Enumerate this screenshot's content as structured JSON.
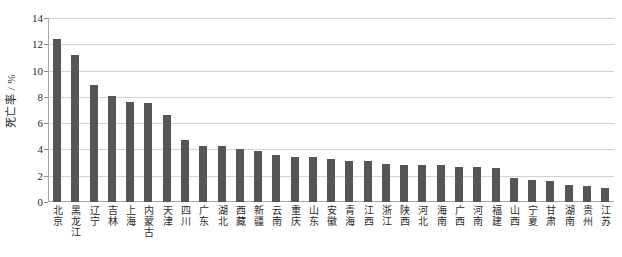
{
  "chart_data": {
    "type": "bar",
    "title": "",
    "xlabel": "",
    "ylabel": "死亡率 / %",
    "ylim": [
      0,
      14
    ],
    "yticks": [
      0,
      2,
      4,
      6,
      8,
      10,
      12,
      14
    ],
    "grid": true,
    "legend": "none",
    "bar_color": "#565656",
    "categories": [
      "北京",
      "黑龙江",
      "辽宁",
      "吉林",
      "上海",
      "内蒙古",
      "天津",
      "四川",
      "广东",
      "湖北",
      "西藏",
      "新疆",
      "云南",
      "重庆",
      "山东",
      "安徽",
      "青海",
      "江西",
      "浙江",
      "陕西",
      "河北",
      "海南",
      "广西",
      "河南",
      "福建",
      "山西",
      "宁夏",
      "甘肃",
      "湖南",
      "贵州",
      "江苏"
    ],
    "values": [
      12.4,
      11.2,
      8.9,
      8.1,
      7.6,
      7.5,
      6.6,
      4.7,
      4.3,
      4.3,
      4.0,
      3.9,
      3.6,
      3.4,
      3.4,
      3.3,
      3.1,
      3.1,
      2.9,
      2.8,
      2.8,
      2.8,
      2.7,
      2.7,
      2.6,
      1.8,
      1.7,
      1.6,
      1.3,
      1.2,
      1.1
    ]
  }
}
